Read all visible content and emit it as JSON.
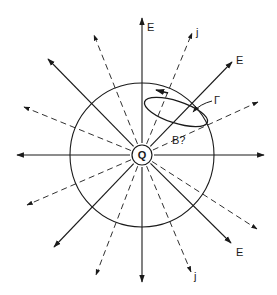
{
  "diagram": {
    "center": {
      "x": 142,
      "y": 155
    },
    "circle_radius": 72,
    "charge_radius": 10,
    "charge_label": "Q",
    "field_label": "E",
    "current_label": "j",
    "loop_label": "Γ",
    "magnetic_question_label": "B?",
    "colors": {
      "stroke": "#1a1a1a",
      "background": "#ffffff"
    },
    "solid_rays": [
      {
        "name": "e-up",
        "x": 142,
        "y": 18
      },
      {
        "name": "e-down",
        "x": 142,
        "y": 282
      },
      {
        "name": "e-left",
        "x": 17,
        "y": 155
      },
      {
        "name": "e-right",
        "x": 264,
        "y": 155
      },
      {
        "name": "e-ne",
        "x": 232,
        "y": 62
      },
      {
        "name": "e-nw",
        "x": 48,
        "y": 59
      },
      {
        "name": "e-sw",
        "x": 54,
        "y": 247
      },
      {
        "name": "e-se",
        "x": 231,
        "y": 243
      }
    ],
    "dashed_rays": [
      {
        "name": "j-nne",
        "x": 192,
        "y": 33
      },
      {
        "name": "j-nnw",
        "x": 94,
        "y": 35
      },
      {
        "name": "j-wnw",
        "x": 24,
        "y": 107
      },
      {
        "name": "j-ene",
        "x": 258,
        "y": 102
      },
      {
        "name": "j-wsw",
        "x": 27,
        "y": 205
      },
      {
        "name": "j-ese",
        "x": 257,
        "y": 229
      },
      {
        "name": "j-ssw",
        "x": 96,
        "y": 275
      },
      {
        "name": "j-sse",
        "x": 191,
        "y": 272
      }
    ],
    "labels": [
      {
        "name": "label-e-top",
        "text": "E",
        "x": 147,
        "y": 31
      },
      {
        "name": "label-j-top",
        "text": "j",
        "x": 196,
        "y": 36
      },
      {
        "name": "label-e-ne",
        "text": "E",
        "x": 236,
        "y": 64
      },
      {
        "name": "label-gamma",
        "text": "Γ",
        "x": 214,
        "y": 104
      },
      {
        "name": "label-b",
        "text": "B?",
        "x": 172,
        "y": 144
      },
      {
        "name": "label-e-se",
        "text": "E",
        "x": 236,
        "y": 256
      },
      {
        "name": "label-j-bottom",
        "text": "j",
        "x": 194,
        "y": 280
      }
    ]
  }
}
